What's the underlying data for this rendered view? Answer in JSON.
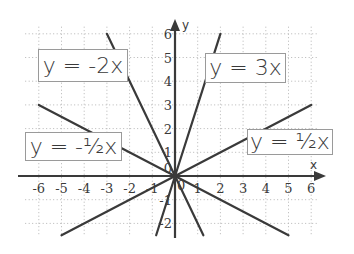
{
  "chart_data": {
    "type": "line",
    "title": "",
    "xlabel": "x",
    "ylabel": "y",
    "xlim": [
      -6,
      6
    ],
    "ylim": [
      -2.5,
      6
    ],
    "grid": true,
    "x_ticks": [
      "-6",
      "-5",
      "-4",
      "-3",
      "-2",
      "-1",
      "0",
      "1",
      "2",
      "3",
      "4",
      "5",
      "6"
    ],
    "y_ticks": [
      "-2",
      "-1",
      "0",
      "1",
      "2",
      "3",
      "4",
      "5",
      "6"
    ],
    "series": [
      {
        "name": "y = -2x",
        "slope": -2,
        "x": [
          -3,
          1.25
        ],
        "y": [
          6,
          -2.5
        ]
      },
      {
        "name": "y = 3x",
        "slope": 3,
        "x": [
          -0.83,
          2
        ],
        "y": [
          -2.5,
          6
        ]
      },
      {
        "name": "y = -1/2x",
        "slope": -0.5,
        "x": [
          -6,
          5
        ],
        "y": [
          3,
          -2.5
        ]
      },
      {
        "name": "y = 1/2x",
        "slope": 0.5,
        "x": [
          -5,
          6
        ],
        "y": [
          -2.5,
          3
        ]
      }
    ],
    "annotations": [
      {
        "text": "y = -2x",
        "near_series": "y = -2x"
      },
      {
        "text": "y = 3x",
        "near_series": "y = 3x"
      },
      {
        "text": "y = -½x",
        "near_series": "y = -1/2x"
      },
      {
        "text": "y = ½x",
        "near_series": "y = 1/2x"
      }
    ]
  },
  "labels": {
    "neg2x": "y = -2x",
    "pos3x": "y = 3x",
    "neghalf": "y = -½x",
    "poshalf": "y = ½x"
  },
  "axes": {
    "x_name": "x",
    "y_name": "y"
  },
  "colors": {
    "line": "#3a3a3a",
    "grid": "#b5b5b5",
    "box_border": "#9a9a9a"
  }
}
